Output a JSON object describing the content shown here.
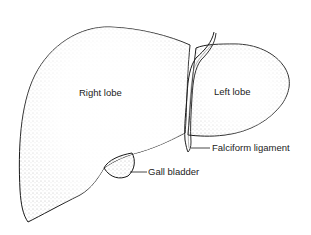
{
  "diagram": {
    "labels": {
      "right_lobe": "Right lobe",
      "left_lobe": "Left lobe",
      "falciform_ligament": "Falciform ligament",
      "gall_bladder": "Gall bladder"
    },
    "colors": {
      "background": "#ffffff",
      "outline": "#1a1a1a",
      "stipple": "#8a8a8a",
      "text": "#222222"
    }
  }
}
